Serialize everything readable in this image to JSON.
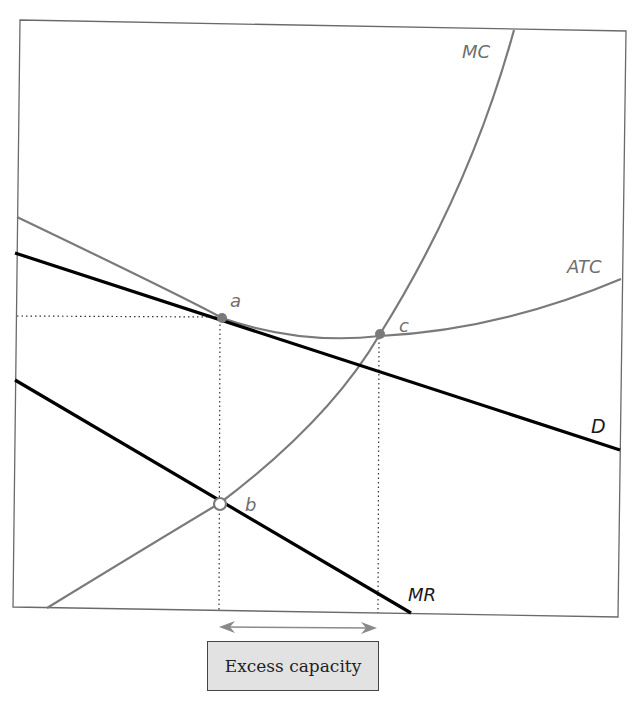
{
  "diagram": {
    "colors": {
      "frame": "#6a6a6a",
      "mc_atc": "#7a7a7a",
      "demand_mr": "#000000",
      "points": "#7a7a7a",
      "caption_bg": "#e2e2e2"
    },
    "curves": [
      {
        "id": "MC",
        "label": "MC",
        "color": "gray"
      },
      {
        "id": "ATC",
        "label": "ATC",
        "color": "gray"
      },
      {
        "id": "D",
        "label": "D",
        "color": "black"
      },
      {
        "id": "MR",
        "label": "MR",
        "color": "black"
      }
    ],
    "points": [
      {
        "id": "a",
        "label": "a",
        "desc": "D tangent to ATC (long-run equilibrium)",
        "style": "filled"
      },
      {
        "id": "b",
        "label": "b",
        "desc": "MR = MC",
        "style": "hollow"
      },
      {
        "id": "c",
        "label": "c",
        "desc": "minimum of ATC (MC = ATC)",
        "style": "filled"
      }
    ],
    "labels": {
      "mc": "MC",
      "atc": "ATC",
      "d": "D",
      "mr": "MR",
      "a": "a",
      "b": "b",
      "c": "c"
    },
    "annotation": {
      "arrow": "double-headed arrow between output at a/b and output at c",
      "caption": "Excess capacity"
    }
  }
}
